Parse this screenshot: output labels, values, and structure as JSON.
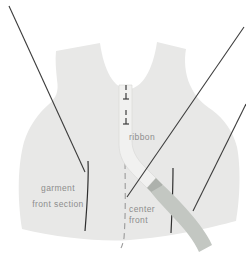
{
  "figure": {
    "type": "sewing-pattern-diagram",
    "labels": {
      "garment": {
        "line1": "garment",
        "line2": "front section"
      },
      "ribbon": "ribbon",
      "center_front": {
        "line1": "center",
        "line2": "front"
      }
    },
    "colors": {
      "background": "#ffffff",
      "garment_fill": "#e8e8e7",
      "ribbon_upper_fill": "#f1f1f0",
      "ribbon_edge": "#d7d7d5",
      "ribbon_lower_fill": "#c3c7c2",
      "ribbon_twist_fill": "#adb1ac",
      "leader_line": "#3c3c3c",
      "marking_line": "#2f2f2f",
      "dash_line": "#9a9a9a",
      "label_text": "#8d8d8d"
    }
  }
}
